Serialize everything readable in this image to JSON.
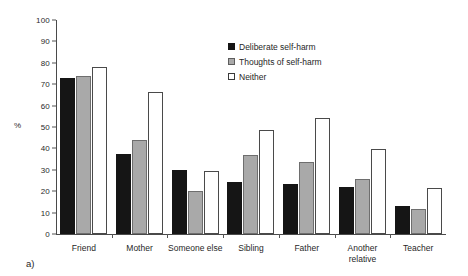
{
  "caption": "a)",
  "axis": {
    "y_unit_label": "%",
    "y_ticks": [
      0,
      10,
      20,
      30,
      40,
      50,
      60,
      70,
      80,
      90,
      100
    ]
  },
  "legend": {
    "items": [
      {
        "label": "Deliberate self-harm",
        "swatch": "black-square-icon",
        "color": "#151515"
      },
      {
        "label": "Thoughts of self-harm",
        "swatch": "gray-square-icon",
        "color": "#a9a9a9"
      },
      {
        "label": "Neither",
        "swatch": "white-square-icon",
        "color": "#ffffff"
      }
    ]
  },
  "chart_data": {
    "type": "bar",
    "title": "",
    "xlabel": "",
    "ylabel": "%",
    "ylim": [
      0,
      100
    ],
    "ytick_step": 10,
    "grid": false,
    "legend_position": "inside-top-center",
    "categories": [
      "Friend",
      "Mother",
      "Someone else",
      "Sibling",
      "Father",
      "Another relative",
      "Teacher"
    ],
    "series": [
      {
        "name": "Deliberate self-harm",
        "values": [
          73,
          37.5,
          30,
          24.5,
          23.5,
          22,
          13
        ]
      },
      {
        "name": "Thoughts of self-harm",
        "values": [
          74,
          44,
          20,
          37,
          33.5,
          25.5,
          11.5
        ]
      },
      {
        "name": "Neither",
        "values": [
          78,
          66.5,
          29.5,
          48.5,
          54,
          39.5,
          21.5
        ]
      }
    ]
  }
}
